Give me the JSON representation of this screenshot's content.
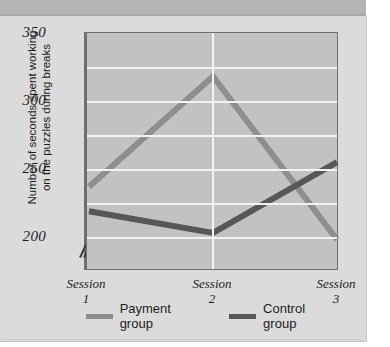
{
  "figure": {
    "background_color": "#dbdbdb",
    "plot_background_color": "#c2c2c2",
    "gridline_color": "#f2f2f2"
  },
  "axis": {
    "y_title_line1": "Number of seconds spent working",
    "y_title_line2": "on the puzzles during breaks",
    "y_ticks": [
      "350",
      "300",
      "250",
      "200"
    ],
    "y_break_symbol": "axis-break-slashes"
  },
  "legend": {
    "items": [
      {
        "label": "Payment group",
        "color": "#8e8e8e"
      },
      {
        "label": "Control group",
        "color": "#575757"
      }
    ]
  },
  "chart_data": {
    "type": "line",
    "title": "",
    "xlabel": "",
    "ylabel": "Number of seconds spent working on the puzzles during breaks",
    "categories": [
      "Session 1",
      "Session 2",
      "Session 3"
    ],
    "category_lines": [
      [
        "Session",
        "1"
      ],
      [
        "Session",
        "2"
      ],
      [
        "Session",
        "3"
      ]
    ],
    "ylim": [
      175,
      350
    ],
    "yticks": [
      200,
      250,
      300,
      350
    ],
    "minor_gridlines": [
      225,
      275,
      325
    ],
    "grid": true,
    "y_axis_break": true,
    "legend_position": "bottom",
    "series": [
      {
        "name": "Payment group",
        "color": "#8e8e8e",
        "values": [
          237,
          318,
          198
        ]
      },
      {
        "name": "Control group",
        "color": "#575757",
        "values": [
          219,
          203,
          255
        ]
      }
    ]
  }
}
